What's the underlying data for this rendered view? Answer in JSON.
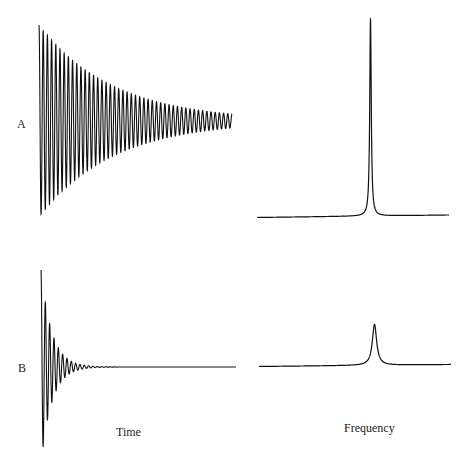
{
  "labels": {
    "row_a": "A",
    "row_b": "B",
    "x_time": "Time",
    "x_frequency": "Frequency"
  },
  "colors": {
    "line": "#111111",
    "background": "#ffffff"
  },
  "chart_data": [
    {
      "type": "line",
      "title": "A — time domain (slow decay)",
      "xlabel": "Time",
      "ylabel": "",
      "description": "Damped sinusoid with slow exponential decay; ~45 visible cycles",
      "start_amplitude": 1.0,
      "decay": "slow",
      "grid": false
    },
    {
      "type": "line",
      "title": "A — frequency domain",
      "xlabel": "Frequency",
      "description": "Very narrow, tall Lorentzian peak",
      "peak_position": 0.6,
      "relative_height": 1.0,
      "width": "narrow",
      "grid": false
    },
    {
      "type": "line",
      "title": "B — time domain (fast decay)",
      "xlabel": "Time",
      "description": "Damped sinusoid with fast exponential decay; ~8 visible cycles",
      "start_amplitude": 1.0,
      "decay": "fast",
      "grid": false
    },
    {
      "type": "line",
      "title": "B — frequency domain",
      "xlabel": "Frequency",
      "description": "Broader, shorter Lorentzian peak",
      "peak_position": 0.6,
      "relative_height": 0.21,
      "width": "broad",
      "grid": false
    }
  ]
}
